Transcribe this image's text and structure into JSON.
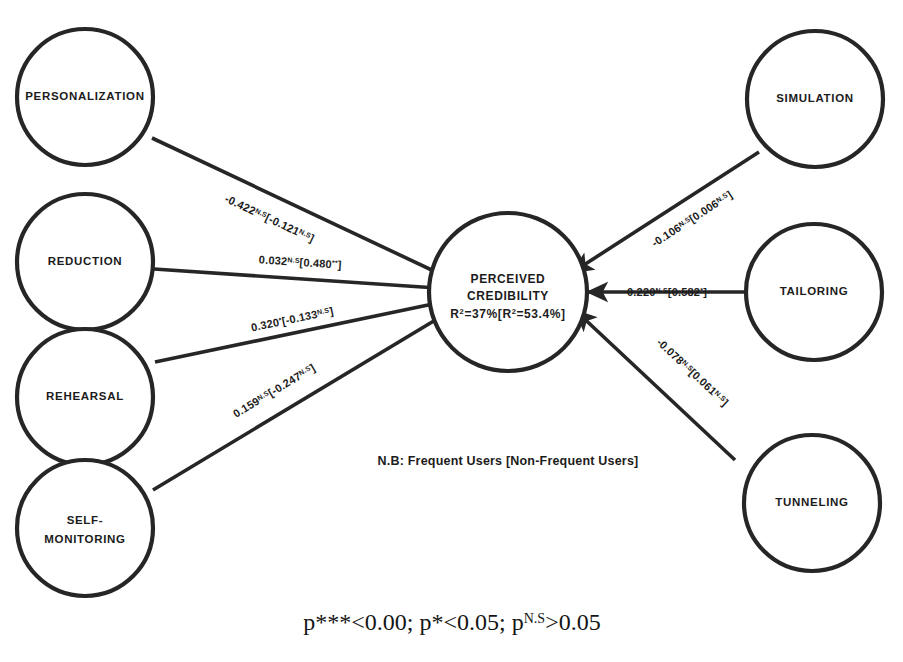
{
  "diagram": {
    "note": "N.B: Frequent Users [Non-Frequent Users]",
    "footnote": {
      "part1": "p***<0.00; p*<0.05; p",
      "sup": "N.S",
      "part2": ">0.05"
    },
    "colors": {
      "stroke": "#262626",
      "text": "#1c1c1c",
      "background": "#ffffff"
    },
    "center_node": {
      "name": "perceived-credibility",
      "line1": "PERCEIVED",
      "line2": "CREDIBILITY",
      "line3_pre": "R",
      "line3_sup1": "2",
      "line3_mid": "=37%[R",
      "line3_sup2": "2",
      "line3_end": "=53.4%]"
    },
    "left_nodes": [
      {
        "name": "personalization",
        "label": "PERSONALIZATION",
        "label2": ""
      },
      {
        "name": "reduction",
        "label": "REDUCTION",
        "label2": ""
      },
      {
        "name": "rehearsal",
        "label": "REHEARSAL",
        "label2": ""
      },
      {
        "name": "self-monitoring",
        "label": "SELF-",
        "label2": "MONITORING"
      }
    ],
    "right_nodes": [
      {
        "name": "simulation",
        "label": "SIMULATION",
        "label2": ""
      },
      {
        "name": "tailoring",
        "label": "TAILORING",
        "label2": ""
      },
      {
        "name": "tunneling",
        "label": "TUNNELING",
        "label2": ""
      }
    ],
    "edges": [
      {
        "name": "edge-personalization",
        "from": "PERSONALIZATION",
        "to": "PERCEIVED CREDIBILITY",
        "frequent": "-0.422",
        "frequent_sig": "N.S",
        "nonfrequent": "[-0.121",
        "nonfrequent_sig": "N.S",
        "close": "]"
      },
      {
        "name": "edge-reduction",
        "from": "REDUCTION",
        "to": "PERCEIVED CREDIBILITY",
        "frequent": "0.032",
        "frequent_sig": "N.S",
        "nonfrequent": "[0.480",
        "nonfrequent_sig": "**",
        "close": "]"
      },
      {
        "name": "edge-rehearsal",
        "from": "REHEARSAL",
        "to": "PERCEIVED CREDIBILITY",
        "frequent": "0.320",
        "frequent_sig": "*",
        "nonfrequent": "[-0.133",
        "nonfrequent_sig": "N.S",
        "close": "]"
      },
      {
        "name": "edge-self-monitoring",
        "from": "SELF-MONITORING",
        "to": "PERCEIVED CREDIBILITY",
        "frequent": "0.159",
        "frequent_sig": "N.S",
        "nonfrequent": "[-0.247",
        "nonfrequent_sig": "N.S",
        "close": "]"
      },
      {
        "name": "edge-simulation",
        "from": "SIMULATION",
        "to": "PERCEIVED CREDIBILITY",
        "frequent": "-0.106",
        "frequent_sig": "N.S",
        "nonfrequent": "[0.006",
        "nonfrequent_sig": "N.S",
        "close": "]"
      },
      {
        "name": "edge-tailoring",
        "from": "TAILORING",
        "to": "PERCEIVED CREDIBILITY",
        "frequent": "0.220",
        "frequent_sig": "N.S",
        "nonfrequent": "[0.582",
        "nonfrequent_sig": "*",
        "close": "]"
      },
      {
        "name": "edge-tunneling",
        "from": "TUNNELING",
        "to": "PERCEIVED CREDIBILITY",
        "frequent": "-0.078",
        "frequent_sig": "N.S",
        "nonfrequent": "[0.061",
        "nonfrequent_sig": "N.S",
        "close": "]"
      }
    ]
  }
}
